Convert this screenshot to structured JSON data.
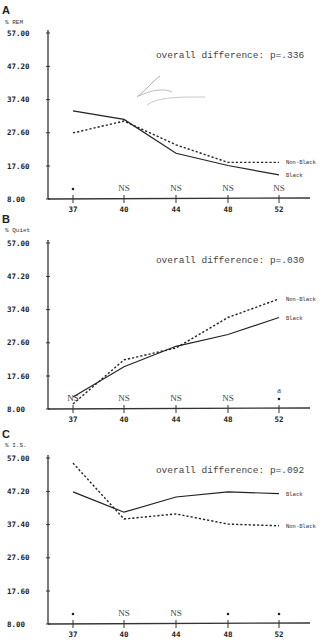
{
  "chart_data": [
    {
      "panel": "A",
      "type": "line",
      "ylabel": "% REM",
      "xlabel": "",
      "categories": [
        "37",
        "40",
        "44",
        "48",
        "52"
      ],
      "yticks": [
        "57.00",
        "47.20",
        "37.40",
        "27.60",
        "17.60",
        "8.00"
      ],
      "ylim": [
        8.0,
        57.0
      ],
      "series": [
        {
          "name": "Black",
          "style": "solid",
          "values": [
            34.0,
            31.5,
            21.5,
            17.9,
            15.1
          ]
        },
        {
          "name": "Non-Black",
          "style": "dashed",
          "values": [
            27.5,
            31.0,
            24.0,
            18.8,
            18.8
          ]
        }
      ],
      "significance": [
        "*",
        "NS",
        "NS",
        "NS",
        "NS"
      ],
      "annotation": "overall difference:  p=.336",
      "grid": false
    },
    {
      "panel": "B",
      "type": "line",
      "ylabel": "% Quiet",
      "xlabel": "",
      "categories": [
        "37",
        "40",
        "44",
        "48",
        "52"
      ],
      "yticks": [
        "57.00",
        "47.20",
        "37.40",
        "27.60",
        "17.60",
        "8.00"
      ],
      "ylim": [
        8.0,
        57.0
      ],
      "series": [
        {
          "name": "Black",
          "style": "solid",
          "values": [
            11.5,
            20.5,
            26.5,
            30.0,
            35.0
          ]
        },
        {
          "name": "Non-Black",
          "style": "dashed",
          "values": [
            9.5,
            22.5,
            26.0,
            35.0,
            40.5
          ]
        }
      ],
      "significance": [
        "NS",
        "NS",
        "NS",
        "NS",
        "a *"
      ],
      "annotation": "overall difference:  p=.030",
      "grid": false
    },
    {
      "panel": "C",
      "type": "line",
      "ylabel": "% I.S.",
      "xlabel": "",
      "categories": [
        "37",
        "40",
        "44",
        "48",
        "52"
      ],
      "yticks": [
        "57.00",
        "47.20",
        "37.40",
        "27.60",
        "17.60",
        "8.00"
      ],
      "ylim": [
        8.0,
        57.0
      ],
      "series": [
        {
          "name": "Black",
          "style": "solid",
          "values": [
            47.0,
            41.0,
            45.5,
            47.0,
            46.5
          ]
        },
        {
          "name": "Non-Black",
          "style": "dashed",
          "values": [
            55.5,
            39.0,
            40.5,
            37.5,
            37.0
          ]
        }
      ],
      "significance": [
        "*",
        "NS",
        "NS",
        "*",
        "*"
      ],
      "annotation": "overall difference:  p=.092",
      "grid": false
    }
  ],
  "panels": [
    {
      "letter": "A",
      "ylabel": "% REM",
      "annotation": "overall difference:  p=.336",
      "legend_top": "Non-Black",
      "legend_bottom": "Black"
    },
    {
      "letter": "B",
      "ylabel": "% Quiet",
      "annotation": "overall difference:  p=.030",
      "legend_top": "Non-Black",
      "legend_bottom": "Black"
    },
    {
      "letter": "C",
      "ylabel": "% I.S.",
      "annotation": "overall difference:  p=.092",
      "legend_top": "Black",
      "legend_bottom": "Non-Black"
    }
  ]
}
